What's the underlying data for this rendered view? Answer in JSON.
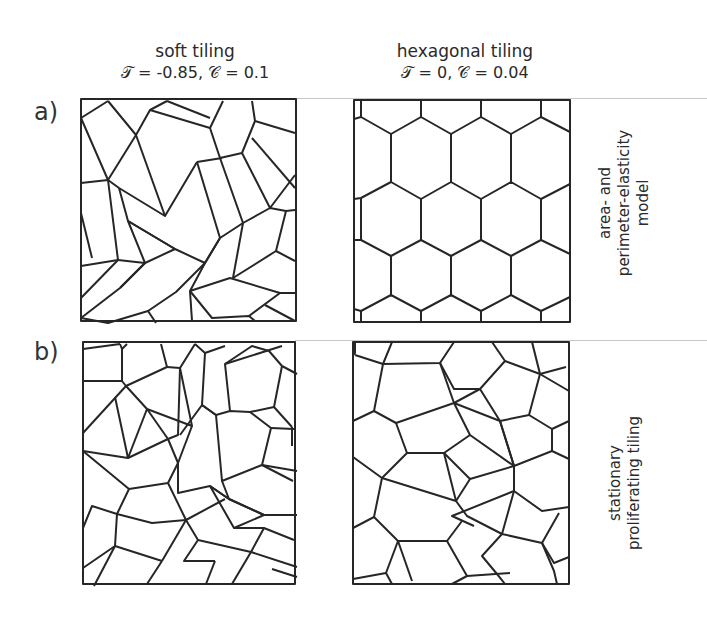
{
  "columns": [
    {
      "title": "soft tiling",
      "params": "𝒯 = -0.85, 𝒞 = 0.1"
    },
    {
      "title": "hexagonal tiling",
      "params": "𝒯 = 0, 𝒞 = 0.04"
    }
  ],
  "rows": [
    {
      "label": "a)",
      "side_label": [
        "area- and",
        "perimeter-elasticity",
        "model"
      ]
    },
    {
      "label": "b)",
      "side_label": [
        "stationary",
        "proliferating tiling"
      ]
    }
  ],
  "colors": {
    "edge": "#262626",
    "separator": "#c8c8c8",
    "background": "#ffffff"
  }
}
